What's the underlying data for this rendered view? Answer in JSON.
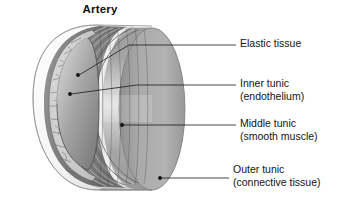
{
  "figure": {
    "title": "Artery",
    "background_color": "#ffffff"
  },
  "labels": [
    {
      "id": "elastic-tissue",
      "line1": "Elastic tissue",
      "line2": "",
      "leader": {
        "dot_x": 78,
        "dot_y": 74,
        "elbow_x": 129,
        "elbow_y": 45,
        "end_x": 236,
        "end_y": 45
      }
    },
    {
      "id": "inner-tunic",
      "line1": "Inner tunic",
      "line2": "(endothelium)",
      "leader": {
        "dot_x": 70,
        "dot_y": 94,
        "elbow_x": 137,
        "elbow_y": 85,
        "end_x": 236,
        "end_y": 85
      }
    },
    {
      "id": "middle-tunic",
      "line1": "Middle tunic",
      "line2": "(smooth muscle)",
      "leader": {
        "dot_x": 122,
        "dot_y": 125,
        "elbow_x": 122,
        "elbow_y": 125,
        "end_x": 236,
        "end_y": 125
      }
    },
    {
      "id": "outer-tunic",
      "line1": "Outer tunic",
      "line2": "(connective tissue)",
      "leader": {
        "dot_x": 160,
        "dot_y": 178,
        "elbow_x": 160,
        "elbow_y": 178,
        "end_x": 229,
        "end_y": 178
      }
    }
  ],
  "colors": {
    "leader_line": "#1a1a1a",
    "outer_wall": "#a9a9a9",
    "outer_wall_highlight": "#d8d8d8",
    "outer_wall_edge": "#8e8e8e",
    "cut_rim_white": "#fdfdfd",
    "muscle_layer": "#8f8f8f",
    "muscle_layer_light": "#c4c4c4",
    "endothelium_cells": "#cfcfcf",
    "lumen_dark": "#7e7e7e",
    "lumen_light": "#c9c9c9",
    "outline": "#2c2c2c",
    "text": "#141414"
  }
}
